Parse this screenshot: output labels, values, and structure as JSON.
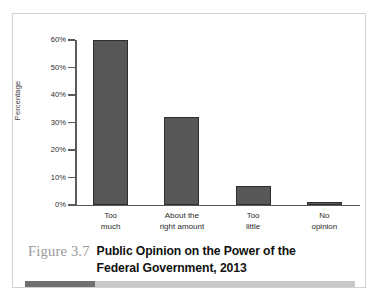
{
  "figure": {
    "number_label": "Figure 3.7",
    "title": "Public Opinion on the Power of the Federal Government, 2013",
    "title_line_1": "Public Opinion on the Power of the",
    "title_line_2": "Federal Government, 2013"
  },
  "colors": {
    "bar_fill": "#575757",
    "bar_stroke": "#2e2e2e",
    "axis": "#5a5a5a",
    "frame": "#d2d2d2",
    "caption_number": "#9a9a9a",
    "caption_title": "#111111",
    "rule_light": "#c9c9c9",
    "rule_accent": "#6f6f6f"
  },
  "chart_data": {
    "type": "bar",
    "title": "Public Opinion on the Power of the Federal Government, 2013",
    "xlabel": "",
    "ylabel": "Percentage",
    "categories": [
      "Too much",
      "About the right amount",
      "Too little",
      "No opinion"
    ],
    "category_lines": [
      [
        "Too",
        "much"
      ],
      [
        "About the",
        "right amount"
      ],
      [
        "Too",
        "little"
      ],
      [
        "No",
        "opinion"
      ]
    ],
    "values": [
      60,
      32,
      7,
      1
    ],
    "value_labels": [
      "60%",
      "32%",
      "7%",
      "1%"
    ],
    "ylim": [
      0,
      60
    ],
    "ytick_values": [
      0,
      10,
      20,
      30,
      40,
      50,
      60
    ],
    "ytick_labels": [
      "0%",
      "10%",
      "20%",
      "30%",
      "40%",
      "50%",
      "60%"
    ],
    "grid": false,
    "legend": null,
    "legend_position": "none"
  }
}
